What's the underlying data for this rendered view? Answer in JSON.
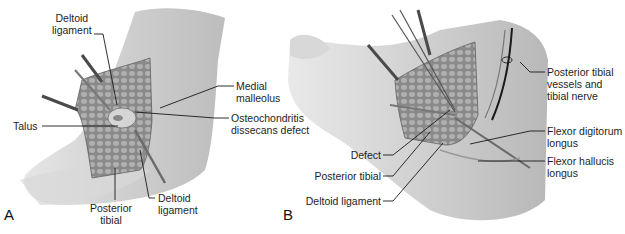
{
  "figure": {
    "panels": [
      {
        "id": "A",
        "letter": "A",
        "labels": {
          "deltoid_ligament_top": [
            "Deltoid",
            "ligament"
          ],
          "medial_malleolus": [
            "Medial",
            "malleolus"
          ],
          "talus": [
            "Talus"
          ],
          "osteochondritis": [
            "Osteochondritis",
            "dissecans defect"
          ],
          "posterior_tibial": [
            "Posterior",
            "tibial"
          ],
          "deltoid_ligament_bottom": [
            "Deltoid",
            "ligament"
          ]
        }
      },
      {
        "id": "B",
        "letter": "B",
        "labels": {
          "posterior_tibial_vessels": [
            "Posterior tibial",
            "vessels and",
            "tibial nerve"
          ],
          "flexor_digitorum": [
            "Flexor digitorum",
            "longus"
          ],
          "flexor_hallucis": [
            "Flexor hallucis",
            "longus"
          ],
          "defect": [
            "Defect"
          ],
          "posterior_tibial": [
            "Posterior tibial"
          ],
          "deltoid_ligament": [
            "Deltoid ligament"
          ]
        }
      }
    ],
    "colors": {
      "skin": "#c9c9c9",
      "skin_light": "#e3e3e3",
      "tissue": "#8c8c8c",
      "retractor": "#5a5a5a",
      "leader": "#1a1a1a"
    }
  }
}
